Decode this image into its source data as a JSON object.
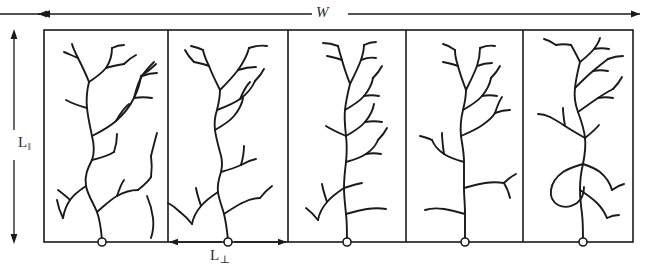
{
  "figure": {
    "kind": "schematic-diagram",
    "stroke_color": "#1a1a1a",
    "background_color": "#ffffff"
  },
  "labels": {
    "width": {
      "text": "W",
      "symbol": "W",
      "orientation": "horizontal",
      "position": "top-center"
    },
    "length_parallel": {
      "text": "L",
      "subscript": "‖",
      "symbol": "L‖",
      "orientation": "vertical",
      "position": "left"
    },
    "length_perpendicular": {
      "text": "L",
      "subscript": "⊥",
      "symbol": "L⊥",
      "orientation": "horizontal",
      "position": "bottom-panel-2"
    }
  },
  "dimension_arrows": [
    {
      "name": "w-arrow",
      "label": "W",
      "direction": "horizontal",
      "heads": "both",
      "x1": 38,
      "x2": 640,
      "y": 14
    },
    {
      "name": "l-parallel-arrow",
      "label": "L‖",
      "direction": "vertical",
      "heads": "both",
      "x": 14,
      "y1": 30,
      "y2": 243
    },
    {
      "name": "l-perp-arrow",
      "label": "L⊥",
      "direction": "horizontal",
      "heads": "both",
      "x1": 169,
      "x2": 287,
      "y": 242
    }
  ],
  "panels": [
    {
      "index": 1,
      "name": "tree-panel-1",
      "x": 44,
      "width": 124,
      "root_x": 102
    },
    {
      "index": 2,
      "name": "tree-panel-2",
      "x": 168,
      "width": 120,
      "root_x": 228
    },
    {
      "index": 3,
      "name": "tree-panel-3",
      "x": 288,
      "width": 118,
      "root_x": 347
    },
    {
      "index": 4,
      "name": "tree-panel-4",
      "x": 406,
      "width": 117,
      "root_x": 465
    },
    {
      "index": 5,
      "name": "tree-panel-5",
      "x": 523,
      "width": 110,
      "root_x": 583
    }
  ],
  "frame": {
    "left": 44,
    "right": 633,
    "top": 30,
    "bottom": 242
  }
}
